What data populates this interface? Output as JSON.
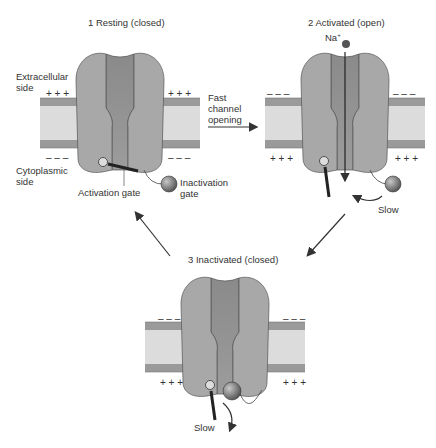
{
  "diagram": {
    "states": [
      {
        "id": "resting",
        "label": "1  Resting (closed)"
      },
      {
        "id": "activated",
        "label": "2  Activated (open)"
      },
      {
        "id": "inactivated",
        "label": "3  Inactivated (closed)"
      }
    ],
    "side_labels": {
      "extracellular_1": "Extracellular",
      "extracellular_2": "side",
      "cytoplasmic_1": "Cytoplasmic",
      "cytoplasmic_2": "side"
    },
    "gate_labels": {
      "activation": "Activation gate",
      "inactivation_1": "Inactivation",
      "inactivation_2": "gate"
    },
    "transition_labels": {
      "fast_1": "Fast",
      "fast_2": "channel",
      "fast_3": "opening",
      "slow_a": "Slow",
      "slow_b": "Slow"
    },
    "ion": {
      "symbol": "Na",
      "charge": "+"
    },
    "charges": {
      "plus": "+ + +",
      "minus": "– – –"
    },
    "colors": {
      "protein": "#a8a8a8",
      "protein_dark": "#8f8f8f",
      "membrane_outer": "#9a9a9a",
      "membrane_inner": "#dcdcdc",
      "ball": "#7a7a7a",
      "line": "#333333"
    }
  }
}
